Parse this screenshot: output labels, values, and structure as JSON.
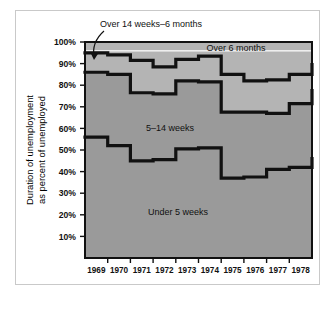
{
  "figure": {
    "name": "unemployment-duration-stacked-area-chart"
  },
  "axes": {
    "y_title_line1": "Duration of unemployment",
    "y_title_line2": "as percent of unemployed",
    "y_ticks": [
      "100%",
      "90%",
      "80%",
      "70%",
      "60%",
      "50%",
      "40%",
      "30%",
      "20%",
      "10%"
    ],
    "x_ticks": [
      "1969",
      "1970",
      "1971",
      "1972",
      "1973",
      "1974",
      "1975",
      "1976",
      "1977",
      "1978"
    ]
  },
  "labels": {
    "over_6_months": "Over 6 months",
    "over_14_weeks": "Over 14 weeks–6 months",
    "five_to_14_weeks": "5–14 weeks",
    "under_5_weeks": "Under 5 weeks"
  },
  "colors": {
    "band_fill_light": "#b4b4b4",
    "band_fill_dark": "#9a9a9a",
    "line": "#111111",
    "frame": "#c9c9c9",
    "highlight": "#eeeeee",
    "background": "#ffffff"
  },
  "chart_data": {
    "type": "area",
    "title": "",
    "subtitle": "",
    "xlabel": "",
    "ylabel": "Duration of unemployment as percent of unemployed",
    "ylim": [
      0,
      100
    ],
    "xlim": [
      1968.5,
      1978.5
    ],
    "grid": false,
    "legend": "inline-annotations",
    "stacking": "cumulative-percent",
    "step_type": "post",
    "x": [
      1968.5,
      1969.0,
      1969.5,
      1970.0,
      1970.5,
      1971.0,
      1971.5,
      1972.0,
      1972.5,
      1973.0,
      1973.5,
      1974.0,
      1974.5,
      1975.0,
      1975.5,
      1976.0,
      1976.5,
      1977.0,
      1977.5,
      1978.0,
      1978.5
    ],
    "categories": [
      "1969",
      "1970",
      "1971",
      "1972",
      "1973",
      "1974",
      "1975",
      "1976",
      "1977",
      "1978"
    ],
    "series": [
      {
        "name": "Under 5 weeks",
        "cumulative_values": [
          56.0,
          56.0,
          52.0,
          52.0,
          45.0,
          45.0,
          45.5,
          45.5,
          50.5,
          50.5,
          51.0,
          51.0,
          37.0,
          37.0,
          37.5,
          37.5,
          41.0,
          41.0,
          42.0,
          42.0,
          46.0
        ]
      },
      {
        "name": "5–14 weeks",
        "cumulative_values": [
          86.0,
          86.0,
          85.0,
          85.0,
          76.5,
          76.5,
          76.0,
          76.0,
          82.0,
          82.0,
          81.5,
          81.5,
          67.5,
          67.5,
          67.5,
          67.5,
          67.0,
          67.0,
          71.5,
          71.5,
          77.5
        ]
      },
      {
        "name": "Over 14 weeks–6 months",
        "cumulative_values": [
          95.0,
          95.0,
          94.0,
          94.0,
          91.5,
          91.5,
          88.5,
          88.5,
          92.0,
          92.0,
          93.5,
          93.5,
          85.0,
          85.0,
          82.0,
          82.0,
          82.5,
          82.5,
          85.0,
          85.0,
          89.5
        ]
      },
      {
        "name": "Over 6 months",
        "cumulative_values": [
          100,
          100,
          100,
          100,
          100,
          100,
          100,
          100,
          100,
          100,
          100,
          100,
          100,
          100,
          100,
          100,
          100,
          100,
          100,
          100,
          100
        ]
      }
    ],
    "annotations": [
      {
        "text": "Over 14 weeks–6 months",
        "target_year": 1969.0,
        "target_value": 94.5
      },
      {
        "text": "Over 6 months",
        "target_year": 1976.5,
        "target_value": 96.0
      },
      {
        "text": "5–14 weeks",
        "target_year": 1972.7,
        "target_value": 64.0
      },
      {
        "text": "Under 5 weeks",
        "target_year": 1973.0,
        "target_value": 22.0
      }
    ]
  }
}
